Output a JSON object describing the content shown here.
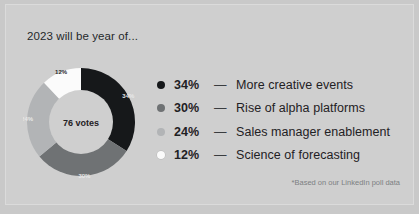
{
  "card": {
    "title": "2023 will be year of...",
    "footnote": "*Based on our LinkedIn poll data",
    "background_color": "#cfcfcf",
    "page_background_color": "#c9c9c9"
  },
  "donut": {
    "center_label": "76 votes",
    "slice_labels": [
      "34%",
      "30%",
      "24%",
      "12%"
    ]
  },
  "legend": {
    "dash": "—",
    "rows": [
      {
        "pct": "34%",
        "label": "More creative events",
        "color": "#16181a"
      },
      {
        "pct": "30%",
        "label": "Rise of alpha platforms",
        "color": "#6f7274"
      },
      {
        "pct": "24%",
        "label": "Sales manager enablement",
        "color": "#b2b4b6"
      },
      {
        "pct": "12%",
        "label": "Science of forecasting",
        "color": "#fbfbfb"
      }
    ]
  },
  "chart_data": {
    "type": "pie",
    "title": "2023 will be year of...",
    "subtitle": "",
    "xlabel": "",
    "ylabel": "",
    "total_label": "76 votes",
    "total_votes": 76,
    "annotation": "*Based on our LinkedIn poll data",
    "legend_position": "right",
    "grid": false,
    "donut": true,
    "inner_radius_ratio": 0.59,
    "start_angle_deg": 0,
    "direction": "clockwise",
    "categories": [
      "More creative events",
      "Rise of alpha platforms",
      "Sales manager enablement",
      "Science of forecasting"
    ],
    "values": [
      34,
      30,
      24,
      12
    ],
    "value_labels": [
      "34%",
      "30%",
      "24%",
      "12%"
    ],
    "unit": "percent",
    "colors": [
      "#16181a",
      "#6f7274",
      "#b2b4b6",
      "#fbfbfb"
    ]
  }
}
